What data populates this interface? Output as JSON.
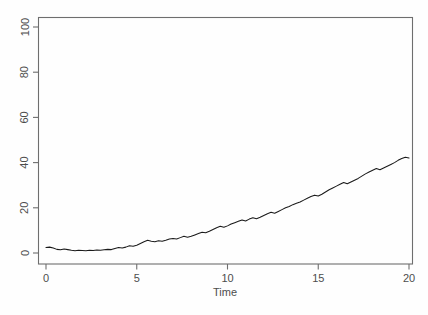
{
  "chart_data": {
    "type": "line",
    "title": "",
    "subtitle": "",
    "xlabel": "Time",
    "ylabel": "",
    "xlim": [
      0,
      20
    ],
    "ylim": [
      0,
      100
    ],
    "grid": false,
    "legend": null,
    "legend_position": "none",
    "xticks": [
      0,
      5,
      10,
      15,
      20
    ],
    "xtick_labels": [
      "0",
      "5",
      "10",
      "15",
      "20"
    ],
    "yticks": [
      0,
      20,
      40,
      60,
      80,
      100
    ],
    "ytick_labels": [
      "0",
      "20",
      "40",
      "60",
      "80",
      "100"
    ],
    "ytick_label_rotation": -90,
    "line_color": "#1a1a1a",
    "frame_color": "#6e6e6e",
    "background_color": "#fefefe",
    "annotations": [],
    "series": [
      {
        "name": "series-1",
        "x": [
          0.0,
          0.2,
          0.4,
          0.6,
          0.8,
          1.0,
          1.2,
          1.4,
          1.6,
          1.8,
          2.0,
          2.2,
          2.4,
          2.6,
          2.8,
          3.0,
          3.2,
          3.4,
          3.6,
          3.8,
          4.0,
          4.2,
          4.4,
          4.6,
          4.8,
          5.0,
          5.2,
          5.4,
          5.6,
          5.8,
          6.0,
          6.2,
          6.4,
          6.6,
          6.8,
          7.0,
          7.2,
          7.4,
          7.6,
          7.8,
          8.0,
          8.2,
          8.4,
          8.6,
          8.8,
          9.0,
          9.2,
          9.4,
          9.6,
          9.8,
          10.0,
          10.2,
          10.4,
          10.6,
          10.8,
          11.0,
          11.2,
          11.4,
          11.6,
          11.8,
          12.0,
          12.2,
          12.4,
          12.6,
          12.8,
          13.0,
          13.2,
          13.4,
          13.6,
          13.8,
          14.0,
          14.2,
          14.4,
          14.6,
          14.8,
          15.0,
          15.2,
          15.4,
          15.6,
          15.8,
          16.0,
          16.2,
          16.4,
          16.6,
          16.8,
          17.0,
          17.2,
          17.4,
          17.6,
          17.8,
          18.0,
          18.2,
          18.4,
          18.6,
          18.8,
          19.0,
          19.2,
          19.4,
          19.6,
          19.8,
          20.0
        ],
        "y": [
          2.4,
          2.6,
          2.2,
          1.6,
          1.4,
          1.8,
          1.5,
          1.2,
          1.0,
          1.2,
          1.1,
          1.0,
          1.2,
          1.1,
          1.3,
          1.2,
          1.4,
          1.6,
          1.5,
          2.0,
          2.4,
          2.2,
          2.6,
          3.2,
          3.0,
          3.4,
          4.2,
          5.0,
          5.6,
          5.2,
          5.0,
          5.4,
          5.2,
          5.6,
          6.2,
          6.4,
          6.2,
          6.8,
          7.4,
          7.0,
          7.4,
          8.0,
          8.6,
          9.2,
          9.0,
          9.6,
          10.4,
          11.2,
          11.8,
          11.4,
          12.0,
          12.8,
          13.4,
          14.0,
          14.6,
          14.2,
          15.0,
          15.6,
          15.2,
          15.8,
          16.6,
          17.4,
          18.0,
          17.6,
          18.4,
          19.2,
          20.0,
          20.6,
          21.4,
          22.0,
          22.6,
          23.4,
          24.2,
          25.0,
          25.6,
          25.2,
          26.0,
          27.0,
          28.0,
          28.8,
          29.6,
          30.4,
          31.2,
          30.6,
          31.4,
          32.2,
          33.0,
          34.0,
          35.0,
          35.8,
          36.6,
          37.4,
          36.8,
          37.6,
          38.4,
          39.2,
          40.0,
          41.0,
          41.8,
          42.4,
          42.0
        ]
      }
    ]
  }
}
